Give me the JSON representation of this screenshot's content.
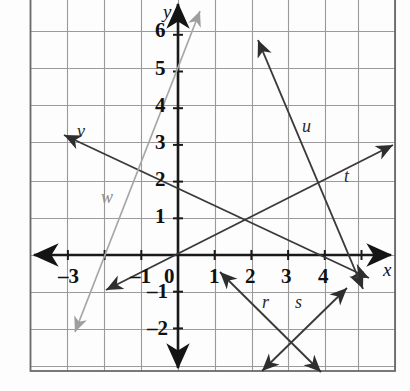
{
  "figure": {
    "kind": "coordinate-grid",
    "background_color": "#fdfdfd",
    "grid_color": "#9a9a9a",
    "grid_minor_color": "#c9c9c9",
    "border_color": "#6a6a6a",
    "axis_color": "#1a1a1a",
    "line_color": "#3a3a3a",
    "faint_line_color": "#a6a6a6"
  },
  "axes": {
    "x_axis_label": "x",
    "y_axis_label": "y",
    "x_label_pos": {
      "x": 383,
      "y": 260
    },
    "y_label_pos": {
      "x": 163,
      "y": 2
    },
    "origin_px": {
      "x": 178,
      "y": 255
    },
    "unit_px": 36.7,
    "x_range": [
      -4,
      5.9
    ],
    "y_range": [
      -2.6,
      6.9
    ],
    "x_ticks": [
      {
        "value": -3,
        "label": "–3",
        "px": {
          "x": 58,
          "y": 266
        }
      },
      {
        "value": -1,
        "label": "–1",
        "px": {
          "x": 130,
          "y": 266
        }
      },
      {
        "value": 0,
        "label": "0",
        "px": {
          "x": 164,
          "y": 266
        }
      },
      {
        "value": 1,
        "label": "1",
        "px": {
          "x": 209,
          "y": 266
        }
      },
      {
        "value": 2,
        "label": "2",
        "px": {
          "x": 245,
          "y": 266
        }
      },
      {
        "value": 3,
        "label": "3",
        "px": {
          "x": 281,
          "y": 266
        }
      },
      {
        "value": 4,
        "label": "4",
        "px": {
          "x": 318,
          "y": 266
        }
      }
    ],
    "y_ticks": [
      {
        "value": 6,
        "label": "6",
        "px": {
          "x": 155,
          "y": 20
        }
      },
      {
        "value": 5,
        "label": "5",
        "px": {
          "x": 155,
          "y": 58
        }
      },
      {
        "value": 4,
        "label": "4",
        "px": {
          "x": 155,
          "y": 95
        }
      },
      {
        "value": 3,
        "label": "3",
        "px": {
          "x": 155,
          "y": 132
        }
      },
      {
        "value": 2,
        "label": "2",
        "px": {
          "x": 155,
          "y": 169
        }
      },
      {
        "value": 1,
        "label": "1",
        "px": {
          "x": 155,
          "y": 206
        }
      },
      {
        "value": -1,
        "label": "–1",
        "px": {
          "x": 147,
          "y": 281
        }
      },
      {
        "value": -2,
        "label": "–2",
        "px": {
          "x": 147,
          "y": 318
        }
      }
    ]
  },
  "plot_box_px": {
    "left": 30,
    "top": 0,
    "right": 395,
    "bottom": 371
  },
  "grid_px": {
    "vertical": [
      30,
      67,
      104,
      141,
      178,
      215,
      252,
      288,
      325,
      358,
      395
    ],
    "horizontal": [
      31,
      68,
      105,
      142,
      181,
      218,
      255,
      292,
      329,
      366
    ]
  },
  "chart_data": {
    "type": "line",
    "title": "",
    "xlabel": "x",
    "ylabel": "y",
    "xlim": [
      -4.0,
      5.9
    ],
    "ylim": [
      -2.6,
      6.9
    ],
    "grid": true,
    "legend": "inline-labels",
    "series": [
      {
        "name": "t",
        "label": "t",
        "label_px": {
          "x": 344,
          "y": 167
        },
        "style": "double-arrow",
        "color": "#3a3a3a",
        "slope": 0.5,
        "y_intercept": 0.0,
        "points": [
          {
            "x": -1.95,
            "y": -0.95
          },
          {
            "x": 5.85,
            "y": 3.0
          }
        ],
        "endpoints_px": [
          {
            "x": 106,
            "y": 290
          },
          {
            "x": 393,
            "y": 145
          }
        ]
      },
      {
        "name": "v",
        "label": "v",
        "label_px": {
          "x": 77,
          "y": 122
        },
        "style": "double-arrow",
        "color": "#3a3a3a",
        "slope": -0.4,
        "y_intercept": 2.0,
        "points": [
          {
            "x": -3.1,
            "y": 3.25
          },
          {
            "x": 5.2,
            "y": -0.6
          }
        ],
        "endpoints_px": [
          {
            "x": 64,
            "y": 135
          },
          {
            "x": 369,
            "y": 278
          }
        ]
      },
      {
        "name": "u",
        "label": "u",
        "label_px": {
          "x": 302,
          "y": 117
        },
        "style": "double-arrow",
        "color": "#3a3a3a",
        "slope": -2.1,
        "y_intercept": 10.5,
        "points": [
          {
            "x": 2.15,
            "y": 5.85
          },
          {
            "x": 5.05,
            "y": -0.9
          }
        ],
        "endpoints_px": [
          {
            "x": 258,
            "y": 40
          },
          {
            "x": 363,
            "y": 289
          }
        ]
      },
      {
        "name": "w",
        "label": "w",
        "label_px": {
          "x": 101,
          "y": 188
        },
        "style": "double-arrow",
        "color": "#a6a6a6",
        "slope": 3.5,
        "y_intercept": 5.0,
        "points": [
          {
            "x": 0.6,
            "y": 6.65
          },
          {
            "x": -2.8,
            "y": -2.1
          }
        ],
        "endpoints_px": [
          {
            "x": 200,
            "y": 11
          },
          {
            "x": 75,
            "y": 332
          }
        ]
      },
      {
        "name": "r",
        "label": "r",
        "label_px": {
          "x": 262,
          "y": 293
        },
        "style": "double-arrow",
        "color": "#3a3a3a",
        "slope": -1.0,
        "y_intercept": 1.0,
        "points": [
          {
            "x": 1.15,
            "y": -0.45
          },
          {
            "x": 3.9,
            "y": -3.2
          }
        ],
        "endpoints_px": [
          {
            "x": 220,
            "y": 272
          },
          {
            "x": 321,
            "y": 372
          }
        ]
      },
      {
        "name": "s",
        "label": "s",
        "label_px": {
          "x": 295,
          "y": 293
        },
        "style": "double-arrow",
        "color": "#3a3a3a",
        "slope": 1.0,
        "y_intercept": -5.0,
        "points": [
          {
            "x": 2.3,
            "y": -3.15
          },
          {
            "x": 4.6,
            "y": -0.9
          }
        ],
        "endpoints_px": [
          {
            "x": 262,
            "y": 371
          },
          {
            "x": 347,
            "y": 288
          }
        ]
      }
    ],
    "intersections": [
      {
        "lines": [
          "r",
          "s"
        ],
        "x": 3,
        "y": -2,
        "px": {
          "x": 288,
          "y": 329
        }
      },
      {
        "lines": [
          "u",
          "v",
          "t"
        ],
        "x": 5,
        "y": 0,
        "px": {
          "x": 357,
          "y": 255
        }
      },
      {
        "lines": [
          "v",
          "t"
        ],
        "x": 2.2,
        "y": 1.1,
        "px": {
          "x": 259,
          "y": 218
        }
      },
      {
        "lines": [
          "u",
          "t"
        ],
        "x": 4.0,
        "y": 2.0,
        "px": {
          "x": 325,
          "y": 181
        }
      }
    ]
  }
}
